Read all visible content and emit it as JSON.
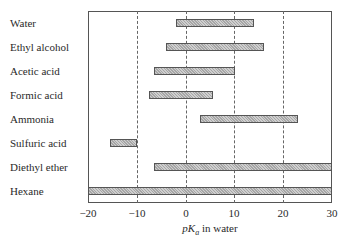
{
  "chart_data": {
    "type": "bar",
    "orientation": "horizontal-range",
    "title": "",
    "xlabel": "pKa in water",
    "ylabel": "",
    "xlim": [
      -20,
      30
    ],
    "xticks": [
      -20,
      -10,
      0,
      10,
      20,
      30
    ],
    "xtick_labels": [
      "−20",
      "−10",
      "0",
      "10",
      "20",
      "30"
    ],
    "grid": "vertical dashed at -10, 0, 10, 20",
    "legend": null,
    "categories": [
      "Water",
      "Ethyl alcohol",
      "Acetic acid",
      "Formic acid",
      "Ammonia",
      "Sulfuric acid",
      "Diethyl ether",
      "Hexane"
    ],
    "ranges": [
      {
        "label": "Water",
        "start": -2,
        "end": 14
      },
      {
        "label": "Ethyl alcohol",
        "start": -4,
        "end": 16
      },
      {
        "label": "Acetic acid",
        "start": -6.5,
        "end": 10
      },
      {
        "label": "Formic acid",
        "start": -7.5,
        "end": 5.7
      },
      {
        "label": "Ammonia",
        "start": 3,
        "end": 23
      },
      {
        "label": "Sulfuric acid",
        "start": -15.5,
        "end": -10
      },
      {
        "label": "Diethyl ether",
        "start": -6.5,
        "end": 30
      },
      {
        "label": "Hexane",
        "start": -20,
        "end": 30
      }
    ]
  },
  "axis": {
    "title_var": "pK",
    "title_sub": "a",
    "title_rest": " in water"
  }
}
